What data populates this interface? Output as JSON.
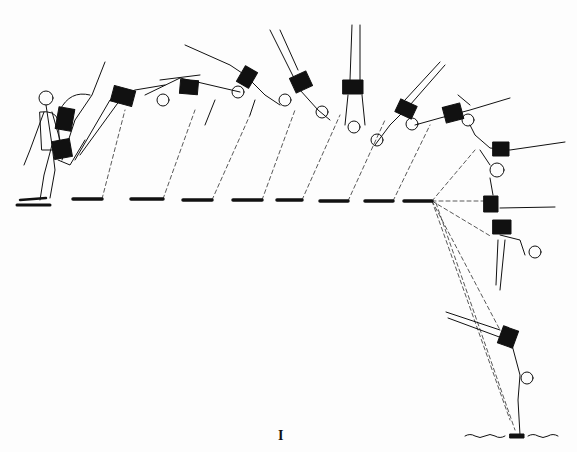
{
  "figure": {
    "label": "I",
    "ink_color": "#111111",
    "background": "#fdfdfd",
    "frames_count": 14
  }
}
